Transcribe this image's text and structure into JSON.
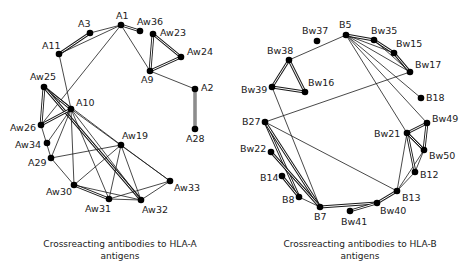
{
  "figures": [
    {
      "id": "hla-a",
      "caption_line1": "Crossreacting antibodies to HLA-A",
      "caption_line2": "antigens",
      "nodes": [
        {
          "id": "A1",
          "label": "A1",
          "x": 121,
          "y": 25,
          "lx": -5,
          "ly": -6
        },
        {
          "id": "A3",
          "label": "A3",
          "x": 90,
          "y": 33,
          "lx": -12,
          "ly": -6
        },
        {
          "id": "A11",
          "label": "A11",
          "x": 59,
          "y": 54,
          "lx": -17,
          "ly": -5
        },
        {
          "id": "Aw36",
          "label": "Aw36",
          "x": 140,
          "y": 31,
          "lx": -3,
          "ly": -6
        },
        {
          "id": "Aw23",
          "label": "Aw23",
          "x": 153,
          "y": 34,
          "lx": 7,
          "ly": 2
        },
        {
          "id": "Aw24",
          "label": "Aw24",
          "x": 181,
          "y": 57,
          "lx": 6,
          "ly": -2
        },
        {
          "id": "A9",
          "label": "A9",
          "x": 150,
          "y": 71,
          "lx": -9,
          "ly": 12
        },
        {
          "id": "A2",
          "label": "A2",
          "x": 195,
          "y": 89,
          "lx": 6,
          "ly": 2
        },
        {
          "id": "A28",
          "label": "A28",
          "x": 195,
          "y": 129,
          "lx": -9,
          "ly": 13
        },
        {
          "id": "Aw25",
          "label": "Aw25",
          "x": 44,
          "y": 87,
          "lx": -14,
          "ly": -7
        },
        {
          "id": "A10",
          "label": "A10",
          "x": 71,
          "y": 109,
          "lx": 5,
          "ly": -3
        },
        {
          "id": "Aw26",
          "label": "Aw26",
          "x": 41,
          "y": 125,
          "lx": -31,
          "ly": 6
        },
        {
          "id": "Aw34",
          "label": "Aw34",
          "x": 47,
          "y": 143,
          "lx": -32,
          "ly": 5
        },
        {
          "id": "A29",
          "label": "A29",
          "x": 51,
          "y": 158,
          "lx": -23,
          "ly": 8
        },
        {
          "id": "Aw19",
          "label": "Aw19",
          "x": 121,
          "y": 145,
          "lx": 1,
          "ly": -6
        },
        {
          "id": "Aw30",
          "label": "Aw30",
          "x": 74,
          "y": 185,
          "lx": -28,
          "ly": 10
        },
        {
          "id": "Aw31",
          "label": "Aw31",
          "x": 109,
          "y": 199,
          "lx": -24,
          "ly": 13
        },
        {
          "id": "Aw32",
          "label": "Aw32",
          "x": 141,
          "y": 200,
          "lx": 1,
          "ly": 13
        },
        {
          "id": "Aw33",
          "label": "Aw33",
          "x": 170,
          "y": 181,
          "lx": 4,
          "ly": 10
        }
      ],
      "edges": [
        {
          "from": "A1",
          "to": "A3",
          "type": "single"
        },
        {
          "from": "A3",
          "to": "A11",
          "type": "double"
        },
        {
          "from": "A1",
          "to": "A11",
          "type": "single"
        },
        {
          "from": "A1",
          "to": "Aw36",
          "type": "double"
        },
        {
          "from": "A1",
          "to": "A9",
          "type": "single"
        },
        {
          "from": "A1",
          "to": "Aw26",
          "type": "single"
        },
        {
          "from": "A11",
          "to": "A10",
          "type": "single"
        },
        {
          "from": "Aw23",
          "to": "Aw24",
          "type": "double"
        },
        {
          "from": "Aw23",
          "to": "A9",
          "type": "double"
        },
        {
          "from": "Aw24",
          "to": "A9",
          "type": "double"
        },
        {
          "from": "A9",
          "to": "A2",
          "type": "single"
        },
        {
          "from": "A2",
          "to": "A28",
          "type": "double"
        },
        {
          "from": "Aw25",
          "to": "Aw26",
          "type": "double"
        },
        {
          "from": "Aw25",
          "to": "A10",
          "type": "double"
        },
        {
          "from": "Aw25",
          "to": "Aw32",
          "type": "double"
        },
        {
          "from": "Aw25",
          "to": "Aw19",
          "type": "single"
        },
        {
          "from": "A10",
          "to": "Aw26",
          "type": "double"
        },
        {
          "from": "A10",
          "to": "Aw34",
          "type": "single"
        },
        {
          "from": "A10",
          "to": "A29",
          "type": "single"
        },
        {
          "from": "A10",
          "to": "Aw30",
          "type": "single"
        },
        {
          "from": "A10",
          "to": "Aw31",
          "type": "single"
        },
        {
          "from": "A10",
          "to": "Aw32",
          "type": "single"
        },
        {
          "from": "A10",
          "to": "Aw33",
          "type": "single"
        },
        {
          "from": "Aw26",
          "to": "A29",
          "type": "single"
        },
        {
          "from": "A29",
          "to": "Aw19",
          "type": "single"
        },
        {
          "from": "A29",
          "to": "Aw30",
          "type": "single"
        },
        {
          "from": "Aw19",
          "to": "Aw30",
          "type": "single"
        },
        {
          "from": "Aw19",
          "to": "Aw31",
          "type": "single"
        },
        {
          "from": "Aw19",
          "to": "Aw32",
          "type": "single"
        },
        {
          "from": "Aw19",
          "to": "Aw33",
          "type": "single"
        },
        {
          "from": "Aw30",
          "to": "Aw31",
          "type": "double"
        },
        {
          "from": "Aw30",
          "to": "Aw32",
          "type": "single"
        },
        {
          "from": "Aw31",
          "to": "Aw32",
          "type": "single"
        },
        {
          "from": "Aw31",
          "to": "Aw33",
          "type": "single"
        },
        {
          "from": "Aw32",
          "to": "Aw33",
          "type": "single"
        }
      ]
    },
    {
      "id": "hla-b",
      "caption_line1": "Crossreacting antibodies to HLA-B",
      "caption_line2": "antigens",
      "nodes": [
        {
          "id": "B5",
          "label": "B5",
          "x": 346,
          "y": 35,
          "lx": -7,
          "ly": -7
        },
        {
          "id": "Bw37",
          "label": "Bw37",
          "x": 317,
          "y": 41,
          "lx": -15,
          "ly": -7
        },
        {
          "id": "Bw35",
          "label": "Bw35",
          "x": 374,
          "y": 40,
          "lx": -3,
          "ly": -6
        },
        {
          "id": "Bw15",
          "label": "Bw15",
          "x": 394,
          "y": 53,
          "lx": 2,
          "ly": -6
        },
        {
          "id": "Bw17",
          "label": "Bw17",
          "x": 410,
          "y": 72,
          "lx": 5,
          "ly": -4
        },
        {
          "id": "B18",
          "label": "B18",
          "x": 421,
          "y": 98,
          "lx": 5,
          "ly": 3
        },
        {
          "id": "Bw38",
          "label": "Bw38",
          "x": 289,
          "y": 60,
          "lx": -22,
          "ly": -6
        },
        {
          "id": "Bw16",
          "label": "Bw16",
          "x": 305,
          "y": 92,
          "lx": 3,
          "ly": -6
        },
        {
          "id": "Bw39",
          "label": "Bw39",
          "x": 272,
          "y": 87,
          "lx": -31,
          "ly": 6
        },
        {
          "id": "B27",
          "label": "B27",
          "x": 265,
          "y": 122,
          "lx": -23,
          "ly": 3
        },
        {
          "id": "Bw22",
          "label": "Bw22",
          "x": 271,
          "y": 152,
          "lx": -31,
          "ly": 0
        },
        {
          "id": "B14",
          "label": "B14",
          "x": 282,
          "y": 176,
          "lx": -22,
          "ly": 5
        },
        {
          "id": "B8",
          "label": "B8",
          "x": 299,
          "y": 197,
          "lx": -17,
          "ly": 6
        },
        {
          "id": "B7",
          "label": "B7",
          "x": 320,
          "y": 207,
          "lx": -6,
          "ly": 13
        },
        {
          "id": "Bw41",
          "label": "Bw41",
          "x": 350,
          "y": 211,
          "lx": -9,
          "ly": 14
        },
        {
          "id": "Bw40",
          "label": "Bw40",
          "x": 377,
          "y": 203,
          "lx": 3,
          "ly": 11
        },
        {
          "id": "B13",
          "label": "B13",
          "x": 397,
          "y": 191,
          "lx": 5,
          "ly": 10
        },
        {
          "id": "B12",
          "label": "B12",
          "x": 415,
          "y": 172,
          "lx": 5,
          "ly": 6
        },
        {
          "id": "Bw50",
          "label": "Bw50",
          "x": 424,
          "y": 150,
          "lx": 5,
          "ly": 9
        },
        {
          "id": "Bw21",
          "label": "Bw21",
          "x": 407,
          "y": 133,
          "lx": -33,
          "ly": 4
        },
        {
          "id": "Bw49",
          "label": "Bw49",
          "x": 427,
          "y": 123,
          "lx": 5,
          "ly": -1
        }
      ],
      "edges": [
        {
          "from": "B5",
          "to": "Bw38",
          "type": "single"
        },
        {
          "from": "B5",
          "to": "Bw35",
          "type": "double"
        },
        {
          "from": "B5",
          "to": "Bw15",
          "type": "single"
        },
        {
          "from": "B5",
          "to": "Bw17",
          "type": "single"
        },
        {
          "from": "B5",
          "to": "B18",
          "type": "single"
        },
        {
          "from": "B5",
          "to": "Bw21",
          "type": "single"
        },
        {
          "from": "B5",
          "to": "Bw49",
          "type": "single"
        },
        {
          "from": "Bw35",
          "to": "Bw15",
          "type": "double"
        },
        {
          "from": "Bw35",
          "to": "Bw17",
          "type": "single"
        },
        {
          "from": "Bw15",
          "to": "Bw17",
          "type": "double"
        },
        {
          "from": "Bw17",
          "to": "B27",
          "type": "single"
        },
        {
          "from": "Bw38",
          "to": "Bw39",
          "type": "double"
        },
        {
          "from": "Bw38",
          "to": "Bw16",
          "type": "double"
        },
        {
          "from": "Bw39",
          "to": "Bw16",
          "type": "double"
        },
        {
          "from": "Bw39",
          "to": "B7",
          "type": "single"
        },
        {
          "from": "B27",
          "to": "B8",
          "type": "double"
        },
        {
          "from": "B27",
          "to": "B7",
          "type": "double"
        },
        {
          "from": "B27",
          "to": "B13",
          "type": "single"
        },
        {
          "from": "Bw22",
          "to": "B7",
          "type": "double"
        },
        {
          "from": "B14",
          "to": "B8",
          "type": "double"
        },
        {
          "from": "B8",
          "to": "B7",
          "type": "single"
        },
        {
          "from": "B7",
          "to": "Bw40",
          "type": "double"
        },
        {
          "from": "Bw41",
          "to": "Bw40",
          "type": "double"
        },
        {
          "from": "Bw40",
          "to": "B13",
          "type": "double"
        },
        {
          "from": "B13",
          "to": "Bw21",
          "type": "single"
        },
        {
          "from": "B13",
          "to": "B12",
          "type": "single"
        },
        {
          "from": "B13",
          "to": "Bw50",
          "type": "single"
        },
        {
          "from": "Bw21",
          "to": "B12",
          "type": "double"
        },
        {
          "from": "Bw21",
          "to": "Bw50",
          "type": "double"
        },
        {
          "from": "Bw21",
          "to": "Bw49",
          "type": "double"
        },
        {
          "from": "Bw49",
          "to": "Bw50",
          "type": "double"
        },
        {
          "from": "B12",
          "to": "Bw50",
          "type": "single"
        }
      ]
    }
  ]
}
